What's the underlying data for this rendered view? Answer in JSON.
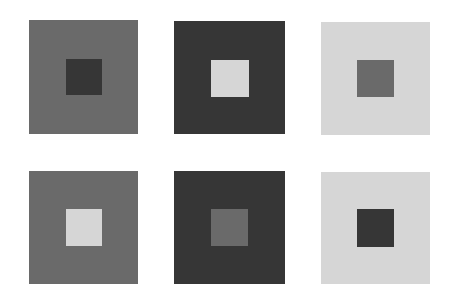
{
  "figure": {
    "background": "#ffffff",
    "palette": {
      "dark": "#363636",
      "mid": "#6a6a6a",
      "light": "#d6d6d6"
    },
    "panels": [
      {
        "row": 1,
        "col": 1,
        "outer": "mid",
        "inner": "dark",
        "outer_box": [
          29,
          20,
          109,
          114
        ],
        "inner_box": [
          66,
          59,
          36,
          36
        ]
      },
      {
        "row": 1,
        "col": 2,
        "outer": "dark",
        "inner": "light",
        "outer_box": [
          174,
          21,
          111,
          113
        ],
        "inner_box": [
          211,
          60,
          38,
          37
        ]
      },
      {
        "row": 1,
        "col": 3,
        "outer": "light",
        "inner": "mid",
        "outer_box": [
          321,
          22,
          109,
          113
        ],
        "inner_box": [
          357,
          60,
          37,
          37
        ]
      },
      {
        "row": 2,
        "col": 1,
        "outer": "mid",
        "inner": "light",
        "outer_box": [
          29,
          171,
          109,
          113
        ],
        "inner_box": [
          66,
          209,
          36,
          37
        ]
      },
      {
        "row": 2,
        "col": 2,
        "outer": "dark",
        "inner": "mid",
        "outer_box": [
          174,
          171,
          111,
          113
        ],
        "inner_box": [
          211,
          209,
          37,
          37
        ]
      },
      {
        "row": 2,
        "col": 3,
        "outer": "light",
        "inner": "dark",
        "outer_box": [
          321,
          172,
          109,
          112
        ],
        "inner_box": [
          357,
          209,
          37,
          38
        ]
      }
    ]
  }
}
